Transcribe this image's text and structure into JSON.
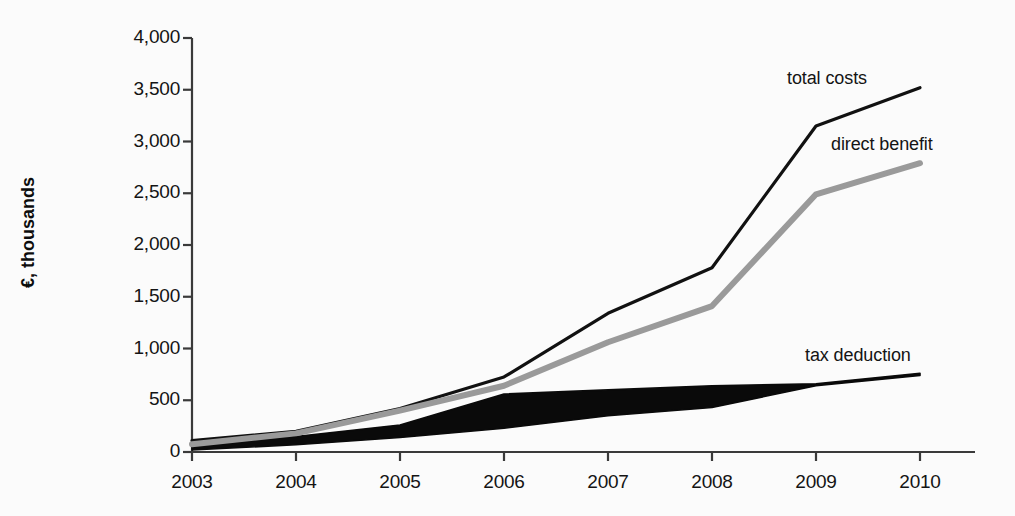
{
  "chart_data": {
    "type": "line",
    "title": "",
    "subtitle": "",
    "xlabel": "",
    "ylabel": "€, thousands",
    "categories": [
      "2003",
      "2004",
      "2005",
      "2006",
      "2007",
      "2008",
      "2009",
      "2010"
    ],
    "x": [
      2003,
      2004,
      2005,
      2006,
      2007,
      2008,
      2009,
      2010
    ],
    "xlim": [
      2003,
      2010
    ],
    "ylim": [
      0,
      4000
    ],
    "ytick_values": [
      0,
      500,
      1000,
      1500,
      2000,
      2500,
      3000,
      3500,
      4000
    ],
    "ytick_labels": [
      "0",
      "500",
      "1,000",
      "1,500",
      "2,000",
      "2,500",
      "3,000",
      "3,500",
      "4,000"
    ],
    "xtick_labels": [
      "2003",
      "2004",
      "2005",
      "2006",
      "2007",
      "2008",
      "2009",
      "2010"
    ],
    "grid": false,
    "legend_position": "inline-annotations",
    "series": [
      {
        "name": "total costs",
        "label": "total costs",
        "color": "#111111",
        "style": "line",
        "values": [
          110,
          200,
          420,
          725,
          1340,
          1780,
          3150,
          3520
        ]
      },
      {
        "name": "direct benefit",
        "label": "direct benefit",
        "color": "#9a9a9a",
        "style": "line",
        "values": [
          75,
          180,
          400,
          640,
          1060,
          1410,
          2490,
          2790
        ]
      },
      {
        "name": "tax deduction",
        "label": "tax deduction",
        "color": "#0a0a0a",
        "style": "band",
        "values": [
          70,
          150,
          260,
          560,
          600,
          640,
          660,
          760
        ],
        "band_upper": [
          70,
          150,
          260,
          560,
          600,
          640,
          660,
          760
        ],
        "band_lower": [
          20,
          70,
          140,
          230,
          350,
          430,
          640,
          740
        ]
      }
    ],
    "annotations": [
      {
        "text": "total costs",
        "series": "total costs",
        "x": 2009,
        "y": 3500
      },
      {
        "text": "direct benefit",
        "series": "direct benefit",
        "x": 2009,
        "y": 2900
      },
      {
        "text": "tax deduction",
        "series": "tax deduction",
        "x": 2008.6,
        "y": 900
      }
    ]
  },
  "axes": {
    "y_axis_label": "€, thousands",
    "y_ticks": [
      {
        "label": "4,000"
      },
      {
        "label": "3,500"
      },
      {
        "label": "3,000"
      },
      {
        "label": "2,500"
      },
      {
        "label": "2,000"
      },
      {
        "label": "1,500"
      },
      {
        "label": "1,000"
      },
      {
        "label": "500"
      },
      {
        "label": "0"
      }
    ],
    "x_ticks": [
      {
        "label": "2003"
      },
      {
        "label": "2004"
      },
      {
        "label": "2005"
      },
      {
        "label": "2006"
      },
      {
        "label": "2007"
      },
      {
        "label": "2008"
      },
      {
        "label": "2009"
      },
      {
        "label": "2010"
      }
    ]
  },
  "annotations": {
    "total_costs": "total costs",
    "direct_benefit": "direct benefit",
    "tax_deduction": "tax deduction"
  },
  "colors": {
    "total_costs": "#111111",
    "direct_benefit": "#9a9a9a",
    "tax_deduction": "#0a0a0a",
    "axis": "#3a3a3a",
    "background": "#fbfbfb",
    "text": "#141414"
  }
}
